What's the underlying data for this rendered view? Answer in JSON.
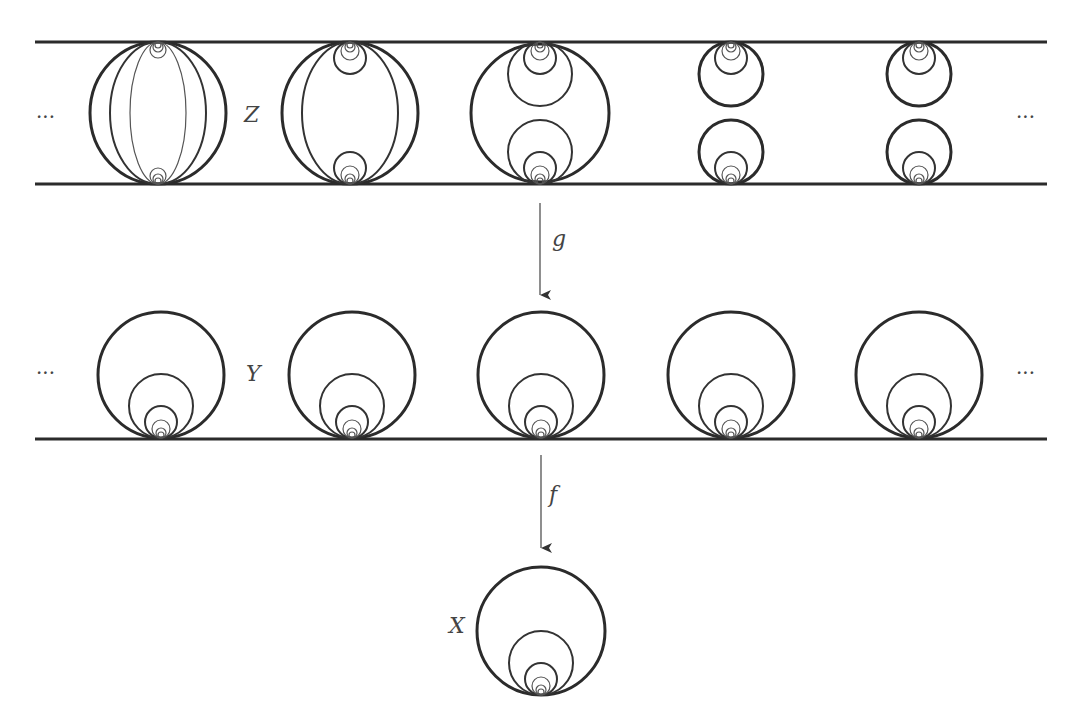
{
  "diagram": {
    "spaces": [
      {
        "name": "Z",
        "label": "Z",
        "description": "strip with sequence of earring-like fibers attached to top and bottom lines"
      },
      {
        "name": "Y",
        "label": "Y",
        "description": "line with Hawaiian earrings attached at integer points"
      },
      {
        "name": "X",
        "label": "X",
        "description": "Hawaiian earring"
      }
    ],
    "maps": [
      {
        "name": "g",
        "label": "g",
        "from": "Z",
        "to": "Y"
      },
      {
        "name": "f",
        "label": "f",
        "from": "Y",
        "to": "X"
      }
    ],
    "ellipsis": "···",
    "z_column_centers": [
      158,
      350,
      540,
      730,
      918
    ],
    "y_column_centers": [
      161,
      352,
      541,
      731,
      918
    ],
    "colors": {
      "stroke": "#2b2b2b",
      "background": "#ffffff"
    }
  }
}
